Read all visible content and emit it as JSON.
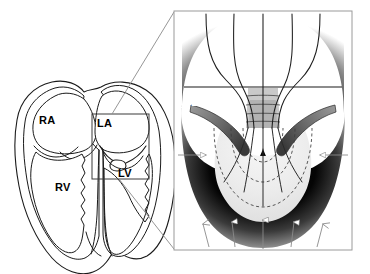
{
  "figure": {
    "background_color": "#ffffff",
    "width": 370,
    "height": 274
  },
  "heart_diagram": {
    "name": "four-chamber-heart-outline",
    "style": {
      "outline_color": "#1a1a1a",
      "fill_color": "#ffffff",
      "stroke_width": 1.1
    },
    "chamber_labels": [
      {
        "id": "ra",
        "text": "RA",
        "x": 39,
        "y": 115,
        "color": "#000000"
      },
      {
        "id": "la",
        "text": "LA",
        "x": 97,
        "y": 118,
        "color": "#000000"
      },
      {
        "id": "rv",
        "text": "RV",
        "x": 55,
        "y": 182,
        "color": "#000000"
      },
      {
        "id": "lv",
        "text": "LV",
        "x": 118,
        "y": 168,
        "color": "#000000"
      }
    ],
    "selection_box": {
      "name": "magnification-region-box",
      "x": 92,
      "y": 114,
      "width": 57,
      "height": 65,
      "stroke_color": "#3a3a3a",
      "stroke_width": 1
    }
  },
  "connector_lines": {
    "name": "magnification-connectors",
    "stroke_color": "#8a8a8a",
    "stroke_width": 0.9,
    "lines": [
      {
        "from_x": 112,
        "from_y": 114,
        "to_x": 174,
        "to_y": 12
      },
      {
        "from_x": 119,
        "from_y": 179,
        "to_x": 174,
        "to_y": 249
      }
    ]
  },
  "inset_panel": {
    "name": "mitral-flow-convergence-inset",
    "x": 174,
    "y": 11,
    "width": 178,
    "height": 239,
    "border_color": "#9a9a9a",
    "border_width": 1,
    "background_color": "#ffffff",
    "labels": [
      {
        "id": "la",
        "text": "LA",
        "x": 191,
        "y": 97,
        "color": "#ffffff"
      },
      {
        "id": "lv",
        "text": "LV",
        "x": 192,
        "y": 121,
        "color": "#ffffff"
      }
    ],
    "colors": {
      "myocardium_dark": "#000000",
      "myocardium_mid": "#585858",
      "blood_pool_light": "#eeeeee",
      "leaflet_gray": "#707070",
      "streamline": "#1c1c1c",
      "isovelocity_contour": "#3d3d3d",
      "arrow_fill": "#ffffff",
      "arrow_stroke": "#6e6e6e"
    },
    "annotations": {
      "streamline_count": 5,
      "bottom_inflow_arrow_count": 5,
      "lateral_arrow_count": 2,
      "isovelocity_shell_count": 3,
      "bottom_arrows_direction": "up",
      "lateral_arrows_direction": "inward"
    }
  }
}
